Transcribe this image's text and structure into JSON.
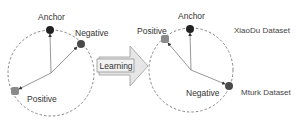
{
  "diagram": {
    "colors": {
      "anchor": "#222222",
      "negative": "#4a4a4a",
      "positive": "#8a8a8a",
      "circle_stroke": "#777777",
      "vector_stroke": "#8c8c8c",
      "arrow_fill": "#e6e6e6",
      "arrow_stroke": "#999999"
    },
    "before": {
      "anchor_label": "Anchor",
      "negative_label": "Negative",
      "positive_label": "Positive"
    },
    "transition": {
      "label": "Learning"
    },
    "after": {
      "anchor_label": "Anchor",
      "positive_label": "Positive",
      "negative_label": "Negative"
    },
    "legend": {
      "dataset_top": "XiaoDu Dataset",
      "dataset_bottom": "Mturk Dataset"
    }
  }
}
